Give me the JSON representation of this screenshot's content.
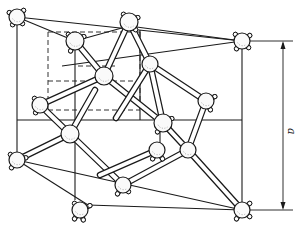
{
  "figure": {
    "title": "",
    "dimension_label": "a"
  },
  "colors": {
    "line": "#1a1a1a",
    "atom_fill": "#fafafa",
    "background": "#ffffff"
  },
  "cube": {
    "front_face": [
      [
        17,
        17
      ],
      [
        242,
        41
      ],
      [
        242,
        210
      ],
      [
        17,
        160
      ]
    ],
    "back_face_edges": [
      [
        [
          62,
          66
        ],
        [
          242,
          41
        ]
      ],
      [
        [
          17,
          160
        ],
        [
          242,
          210
        ]
      ]
    ],
    "solid_edges": [
      [
        [
          17,
          17
        ],
        [
          242,
          41
        ]
      ],
      [
        [
          17,
          17
        ],
        [
          17,
          160
        ]
      ],
      [
        [
          242,
          41
        ],
        [
          242,
          210
        ]
      ],
      [
        [
          17,
          160
        ],
        [
          88,
          205
        ]
      ],
      [
        [
          88,
          205
        ],
        [
          242,
          210
        ]
      ],
      [
        [
          17,
          120
        ],
        [
          242,
          120
        ]
      ],
      [
        [
          75,
          41
        ],
        [
          75,
          200
        ]
      ],
      [
        [
          17,
          17
        ],
        [
          75,
          41
        ]
      ],
      [
        [
          129,
          26
        ],
        [
          242,
          41
        ]
      ],
      [
        [
          75,
          41
        ],
        [
          129,
          26
        ]
      ],
      [
        [
          140,
          30
        ],
        [
          140,
          120
        ]
      ],
      [
        [
          160,
          100
        ],
        [
          160,
          150
        ]
      ]
    ],
    "dashed_edges": [
      [
        [
          48,
          32
        ],
        [
          140,
          32
        ]
      ],
      [
        [
          48,
          32
        ],
        [
          48,
          110
        ]
      ],
      [
        [
          48,
          110
        ],
        [
          140,
          110
        ]
      ],
      [
        [
          140,
          32
        ],
        [
          140,
          110
        ]
      ],
      [
        [
          48,
          81
        ],
        [
          140,
          81
        ]
      ],
      [
        [
          78,
          66
        ],
        [
          118,
          66
        ]
      ]
    ]
  },
  "atoms": [
    {
      "id": "c-tl",
      "x": 17,
      "y": 17,
      "r": 8,
      "stubs": [
        [
          -7,
          -4
        ],
        [
          6,
          -6
        ],
        [
          -4,
          7
        ],
        [
          5,
          6
        ]
      ]
    },
    {
      "id": "c-tr",
      "x": 242,
      "y": 41,
      "r": 8,
      "stubs": [
        [
          -6,
          -6
        ],
        [
          7,
          -5
        ],
        [
          -5,
          7
        ],
        [
          6,
          6
        ]
      ]
    },
    {
      "id": "c-bl",
      "x": 17,
      "y": 160,
      "r": 8,
      "stubs": [
        [
          -6,
          -5
        ],
        [
          -5,
          7
        ],
        [
          8,
          -2
        ]
      ]
    },
    {
      "id": "c-br",
      "x": 242,
      "y": 210,
      "r": 8,
      "stubs": [
        [
          7,
          -6
        ],
        [
          -5,
          8
        ],
        [
          7,
          6
        ]
      ]
    },
    {
      "id": "c-bfl",
      "x": 80,
      "y": 210,
      "r": 8,
      "stubs": [
        [
          -5,
          -6
        ],
        [
          9,
          -4
        ],
        [
          -5,
          8
        ],
        [
          3,
          9
        ]
      ]
    },
    {
      "id": "c-top-back",
      "x": 129,
      "y": 22,
      "r": 9,
      "stubs": [
        [
          -5,
          -7
        ],
        [
          8,
          -4
        ],
        [
          6,
          7
        ]
      ]
    },
    {
      "id": "f-top",
      "x": 75,
      "y": 41,
      "r": 9,
      "stubs": [
        [
          -6,
          -6
        ],
        [
          8,
          -4
        ],
        [
          -4,
          9
        ]
      ]
    },
    {
      "id": "t-1",
      "x": 104,
      "y": 76,
      "r": 9,
      "stubs": []
    },
    {
      "id": "t-2",
      "x": 150,
      "y": 64,
      "r": 8,
      "stubs": []
    },
    {
      "id": "f-left",
      "x": 40,
      "y": 105,
      "r": 8,
      "stubs": [
        [
          -5,
          -6
        ],
        [
          -4,
          7
        ]
      ]
    },
    {
      "id": "t-3",
      "x": 70,
      "y": 134,
      "r": 9,
      "stubs": []
    },
    {
      "id": "f-right",
      "x": 206,
      "y": 101,
      "r": 8,
      "stubs": [
        [
          8,
          -4
        ],
        [
          4,
          8
        ]
      ]
    },
    {
      "id": "f-center",
      "x": 163,
      "y": 123,
      "r": 9,
      "stubs": [
        [
          8,
          -4
        ],
        [
          -5,
          8
        ]
      ]
    },
    {
      "id": "t-4",
      "x": 188,
      "y": 150,
      "r": 8,
      "stubs": []
    },
    {
      "id": "f-mid-low",
      "x": 157,
      "y": 150,
      "r": 8,
      "stubs": [
        [
          -4,
          8
        ],
        [
          5,
          8
        ]
      ]
    },
    {
      "id": "f-bottom",
      "x": 123,
      "y": 185,
      "r": 8,
      "stubs": [
        [
          -5,
          8
        ],
        [
          5,
          6
        ]
      ]
    },
    {
      "id": "f-lower-left",
      "x": 8,
      "y": 30,
      "r": 0,
      "stubs": []
    }
  ],
  "bonds": [
    [
      [
        104,
        76
      ],
      [
        75,
        41
      ]
    ],
    [
      [
        104,
        76
      ],
      [
        129,
        22
      ]
    ],
    [
      [
        104,
        76
      ],
      [
        40,
        105
      ]
    ],
    [
      [
        104,
        76
      ],
      [
        163,
        123
      ]
    ],
    [
      [
        150,
        64
      ],
      [
        129,
        22
      ]
    ],
    [
      [
        150,
        64
      ],
      [
        206,
        101
      ]
    ],
    [
      [
        150,
        64
      ],
      [
        163,
        123
      ]
    ],
    [
      [
        150,
        64
      ],
      [
        116,
        118
      ]
    ],
    [
      [
        70,
        134
      ],
      [
        40,
        105
      ]
    ],
    [
      [
        70,
        134
      ],
      [
        17,
        160
      ]
    ],
    [
      [
        70,
        134
      ],
      [
        123,
        185
      ]
    ],
    [
      [
        70,
        134
      ],
      [
        95,
        90
      ]
    ],
    [
      [
        188,
        150
      ],
      [
        163,
        123
      ]
    ],
    [
      [
        188,
        150
      ],
      [
        206,
        101
      ]
    ],
    [
      [
        188,
        150
      ],
      [
        242,
        210
      ]
    ],
    [
      [
        188,
        150
      ],
      [
        123,
        185
      ]
    ],
    [
      [
        157,
        150
      ],
      [
        100,
        175
      ]
    ]
  ],
  "dimension": {
    "x": 283,
    "y_top": 41,
    "y_bottom": 210,
    "ext_top": [
      [
        250,
        41
      ],
      [
        293,
        41
      ]
    ],
    "ext_bottom": [
      [
        250,
        210
      ],
      [
        293,
        210
      ]
    ],
    "label_pos": [
      288,
      128
    ]
  }
}
